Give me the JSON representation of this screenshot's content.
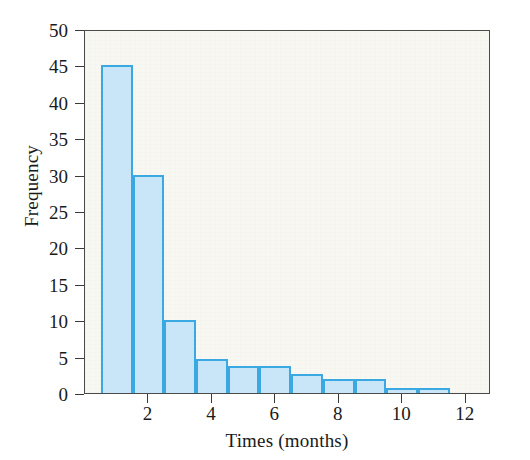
{
  "chart_data": {
    "type": "bar",
    "title": "",
    "subtitle": "",
    "xlabel": "Times (months)",
    "ylabel": "Frequency",
    "xlim": [
      0,
      12.8
    ],
    "ylim": [
      0,
      50
    ],
    "grid": false,
    "legend": null,
    "bin_width": 1,
    "bin_edges": [
      0.5,
      1.5,
      2.5,
      3.5,
      4.5,
      5.5,
      6.5,
      7.5,
      8.5,
      9.5,
      10.5,
      11.5
    ],
    "x_tick_labels": [
      "2",
      "4",
      "6",
      "8",
      "10",
      "12"
    ],
    "x_tick_values": [
      2,
      4,
      6,
      8,
      10,
      12
    ],
    "y_tick_labels": [
      "0",
      "5",
      "10",
      "15",
      "20",
      "25",
      "30",
      "35",
      "40",
      "45",
      "50"
    ],
    "y_tick_values": [
      0,
      5,
      10,
      15,
      20,
      25,
      30,
      35,
      40,
      45,
      50
    ],
    "categories": [
      "0.5-1.5",
      "1.5-2.5",
      "2.5-3.5",
      "3.5-4.5",
      "4.5-5.5",
      "5.5-6.5",
      "6.5-7.5",
      "7.5-8.5",
      "8.5-9.5",
      "9.5-10.5",
      "10.5-11.5"
    ],
    "values": [
      45,
      30,
      10,
      4.7,
      3.7,
      3.7,
      2.6,
      1.9,
      1.9,
      0.7,
      0.7
    ],
    "bar_fill_color": "#c8e6f7",
    "bar_border_color": "#3aa9e2",
    "plot_background_color": "#f3f2ea",
    "axis_color": "#3a3a38",
    "text_color": "#1a1a1a"
  }
}
